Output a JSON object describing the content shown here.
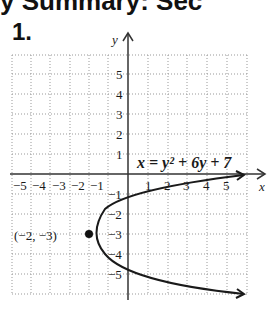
{
  "header": {
    "text": "y Summary: Sec"
  },
  "problem": {
    "number": "1."
  },
  "graph": {
    "x_axis_label": "x",
    "y_axis_label": "y",
    "x_ticks": [
      "−5",
      "−4",
      "−3",
      "−2",
      "−1",
      "1",
      "2",
      "3",
      "4",
      "5"
    ],
    "y_ticks": [
      "5",
      "4",
      "3",
      "2",
      "1",
      "−1",
      "−2",
      "−3",
      "−4",
      "−5"
    ],
    "equation": "x = y² + 6y + 7",
    "vertex_label": "(−2, −3)",
    "vertex": {
      "x": -2,
      "y": -3
    },
    "curve_color": "#1a1a1a"
  }
}
